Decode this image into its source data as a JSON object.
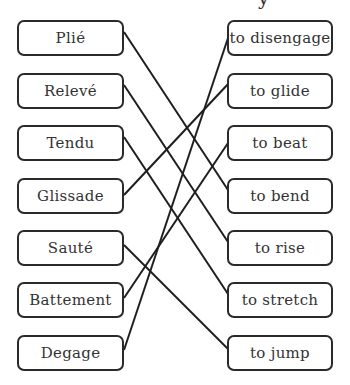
{
  "title_fragment": "y",
  "terms": [
    {
      "label": "Plié",
      "top": 20
    },
    {
      "label": "Relevé",
      "top": 73
    },
    {
      "label": "Tendu",
      "top": 125
    },
    {
      "label": "Glissade",
      "top": 178
    },
    {
      "label": "Sauté",
      "top": 230
    },
    {
      "label": "Battement",
      "top": 282
    },
    {
      "label": "Degage",
      "top": 335
    }
  ],
  "meanings": [
    {
      "label": "to disengage",
      "top": 20
    },
    {
      "label": "to glide",
      "top": 73
    },
    {
      "label": "to beat",
      "top": 125
    },
    {
      "label": "to bend",
      "top": 178
    },
    {
      "label": "to rise",
      "top": 230
    },
    {
      "label": "to stretch",
      "top": 282
    },
    {
      "label": "to jump",
      "top": 335
    }
  ],
  "connections": [
    {
      "term": "Plié",
      "meaning": "to bend"
    },
    {
      "term": "Relevé",
      "meaning": "to rise"
    },
    {
      "term": "Tendu",
      "meaning": "to stretch"
    },
    {
      "term": "Glissade",
      "meaning": "to glide"
    },
    {
      "term": "Sauté",
      "meaning": "to jump"
    },
    {
      "term": "Battement",
      "meaning": "to beat"
    },
    {
      "term": "Degage",
      "meaning": "to disengage"
    }
  ],
  "line_color": "#1e1e1e"
}
